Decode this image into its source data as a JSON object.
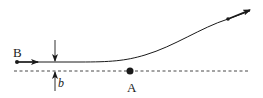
{
  "diagram": {
    "labels": {
      "point_b": "B",
      "point_a": "A",
      "impact_parameter": "b"
    },
    "colors": {
      "stroke": "#1a1a1a",
      "background": "#ffffff"
    },
    "elements": {
      "trajectory": "curved path of particle B deflected near A",
      "reference_line": "dashed horizontal line through A",
      "impact_parameter_markers": "opposing vertical arrows marking distance b"
    }
  }
}
